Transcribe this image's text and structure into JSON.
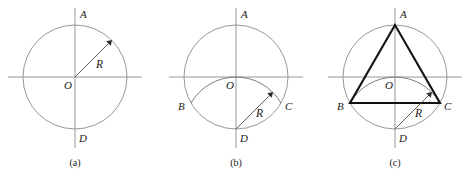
{
  "figure": {
    "background_color": "#ffffff",
    "line_color": "#8c8c8c",
    "triangle_color": "#111111",
    "label_color": "#1a1a1a",
    "panels": [
      {
        "id": "a",
        "caption": "(a)",
        "caption_x": 75,
        "caption_y": 166,
        "center": {
          "x": 75,
          "y": 77
        },
        "radius": 52,
        "axis_h": {
          "x1": 8,
          "y1": 77,
          "x2": 142,
          "y2": 77
        },
        "axis_v": {
          "x1": 75,
          "y1": 8,
          "x2": 75,
          "y2": 148
        },
        "points": [
          {
            "name": "A",
            "label": "A",
            "x": 75,
            "y": 25,
            "label_x": 80,
            "label_y": 18
          },
          {
            "name": "O",
            "label": "O",
            "x": 75,
            "y": 77,
            "label_x": 64,
            "label_y": 89
          },
          {
            "name": "D",
            "label": "D",
            "x": 75,
            "y": 129,
            "label_x": 79,
            "label_y": 142
          }
        ],
        "radius_arrow": {
          "from_x": 75,
          "from_y": 77,
          "to_x": 112,
          "to_y": 40,
          "label": "R",
          "label_x": 96,
          "label_y": 68
        },
        "arc": null,
        "triangle": null
      },
      {
        "id": "b",
        "caption": "(b)",
        "caption_x": 236,
        "caption_y": 166,
        "center": {
          "x": 236,
          "y": 77
        },
        "radius": 52,
        "axis_h": {
          "x1": 169,
          "y1": 77,
          "x2": 303,
          "y2": 77
        },
        "axis_v": {
          "x1": 236,
          "y1": 8,
          "x2": 236,
          "y2": 148
        },
        "points": [
          {
            "name": "A",
            "label": "A",
            "x": 236,
            "y": 25,
            "label_x": 241,
            "label_y": 18
          },
          {
            "name": "O",
            "label": "O",
            "x": 236,
            "y": 77,
            "label_x": 226,
            "label_y": 89
          },
          {
            "name": "B",
            "label": "B",
            "x": 191,
            "y": 103,
            "label_x": 179,
            "label_y": 109
          },
          {
            "name": "C",
            "label": "C",
            "x": 281,
            "y": 103,
            "label_x": 285,
            "label_y": 109
          },
          {
            "name": "D",
            "label": "D",
            "x": 236,
            "y": 129,
            "label_x": 240,
            "label_y": 142
          }
        ],
        "radius_arrow": {
          "from_x": 236,
          "from_y": 129,
          "to_x": 273,
          "to_y": 92,
          "label": "R",
          "label_x": 256,
          "label_y": 116
        },
        "arc": {
          "center_x": 236,
          "center_y": 129,
          "radius": 52,
          "start_x": 191,
          "start_y": 103,
          "end_x": 281,
          "end_y": 103,
          "description": "arc-centered-at-D-through-B-O-C"
        },
        "triangle": null
      },
      {
        "id": "c",
        "caption": "(c)",
        "caption_x": 395,
        "caption_y": 166,
        "center": {
          "x": 395,
          "y": 77
        },
        "radius": 52,
        "axis_h": {
          "x1": 328,
          "y1": 77,
          "x2": 462,
          "y2": 77
        },
        "axis_v": {
          "x1": 395,
          "y1": 8,
          "x2": 395,
          "y2": 148
        },
        "points": [
          {
            "name": "A",
            "label": "A",
            "x": 395,
            "y": 25,
            "label_x": 400,
            "label_y": 18
          },
          {
            "name": "O",
            "label": "O",
            "x": 395,
            "y": 77,
            "label_x": 385,
            "label_y": 89
          },
          {
            "name": "B",
            "label": "B",
            "x": 350,
            "y": 103,
            "label_x": 338,
            "label_y": 109
          },
          {
            "name": "C",
            "label": "C",
            "x": 440,
            "y": 103,
            "label_x": 444,
            "label_y": 109
          },
          {
            "name": "D",
            "label": "D",
            "x": 395,
            "y": 129,
            "label_x": 399,
            "label_y": 142
          }
        ],
        "radius_arrow": {
          "from_x": 395,
          "from_y": 129,
          "to_x": 432,
          "to_y": 92,
          "label": "R",
          "label_x": 415,
          "label_y": 116
        },
        "arc": {
          "center_x": 395,
          "center_y": 129,
          "radius": 52,
          "start_x": 350,
          "start_y": 103,
          "end_x": 440,
          "end_y": 103,
          "description": "arc-centered-at-D-through-B-O-C"
        },
        "triangle": {
          "vertices": [
            {
              "name": "A",
              "x": 395,
              "y": 25
            },
            {
              "name": "B",
              "x": 350,
              "y": 103
            },
            {
              "name": "C",
              "x": 440,
              "y": 103
            }
          ],
          "description": "inscribed-equilateral-triangle"
        }
      }
    ]
  }
}
